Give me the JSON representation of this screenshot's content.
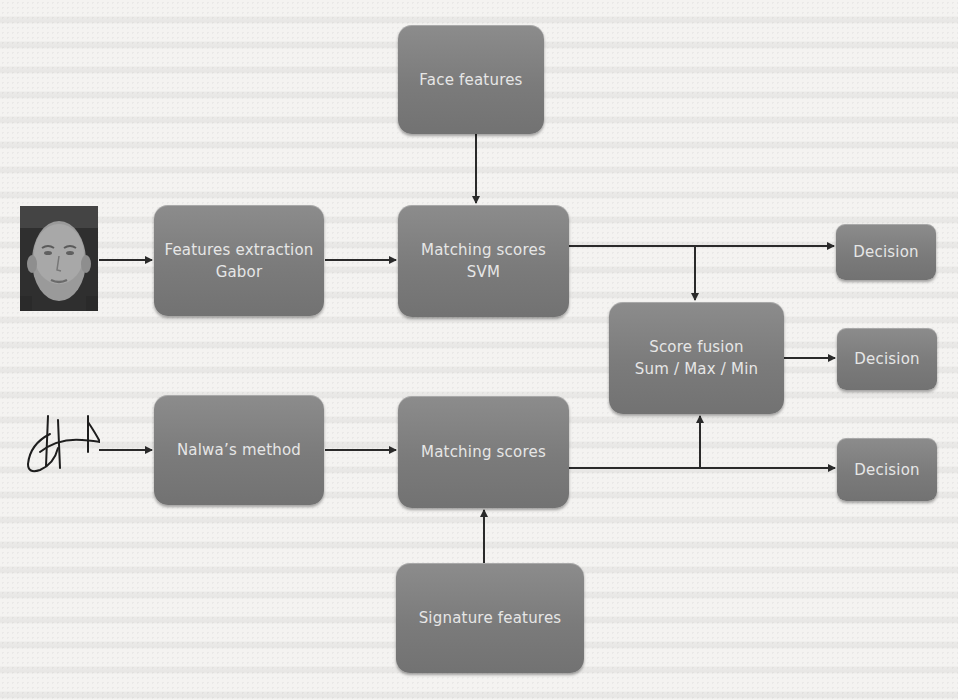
{
  "diagram": {
    "colors": {
      "node_fill": "#7d7d7d",
      "node_text": "#e6e6e6",
      "connector": "#2a2a2a",
      "background": "#f4f3f1"
    },
    "inputs": {
      "face_image": {
        "label": "face-photo"
      },
      "signature_image": {
        "label": "signature-sample"
      }
    },
    "nodes": {
      "face_features": {
        "lines": [
          "Face features"
        ]
      },
      "features_extraction": {
        "lines": [
          "Features extraction",
          "Gabor"
        ]
      },
      "matching_scores_svm": {
        "lines": [
          "Matching scores",
          "SVM"
        ]
      },
      "score_fusion": {
        "lines": [
          "Score fusion",
          "Sum / Max / Min"
        ]
      },
      "nalwa_method": {
        "lines": [
          "Nalwa’s method"
        ]
      },
      "matching_scores": {
        "lines": [
          "Matching scores"
        ]
      },
      "signature_features": {
        "lines": [
          "Signature features"
        ]
      },
      "decision_face": {
        "lines": [
          "Decision"
        ]
      },
      "decision_fusion": {
        "lines": [
          "Decision"
        ]
      },
      "decision_signature": {
        "lines": [
          "Decision"
        ]
      }
    },
    "edges": [
      {
        "from": "face_image",
        "to": "features_extraction"
      },
      {
        "from": "features_extraction",
        "to": "matching_scores_svm"
      },
      {
        "from": "face_features",
        "to": "matching_scores_svm"
      },
      {
        "from": "matching_scores_svm",
        "to": "decision_face"
      },
      {
        "from": "matching_scores_svm",
        "to": "score_fusion"
      },
      {
        "from": "score_fusion",
        "to": "decision_fusion"
      },
      {
        "from": "signature_image",
        "to": "nalwa_method"
      },
      {
        "from": "nalwa_method",
        "to": "matching_scores"
      },
      {
        "from": "signature_features",
        "to": "matching_scores"
      },
      {
        "from": "matching_scores",
        "to": "decision_signature"
      },
      {
        "from": "matching_scores",
        "to": "score_fusion"
      }
    ]
  }
}
